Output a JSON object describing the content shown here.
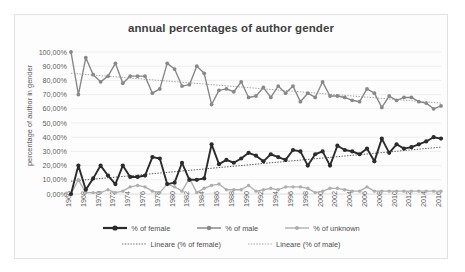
{
  "chart_data": {
    "type": "line",
    "title": "annual percentages of author gender",
    "xlabel": "",
    "ylabel": "percentage of author in gender",
    "ylim": [
      0,
      100
    ],
    "ytick_labels": [
      "100,00%",
      "90,00%",
      "80,00%",
      "70,00%",
      "60,00%",
      "50,00%",
      "40,00%",
      "30,00%",
      "20,00%",
      "10,00%",
      "0,00%"
    ],
    "ytick_values": [
      100,
      90,
      80,
      70,
      60,
      50,
      40,
      30,
      20,
      10,
      0
    ],
    "grid": true,
    "legend_position": "bottom",
    "x": [
      1966,
      1967,
      1968,
      1969,
      1970,
      1971,
      1972,
      1973,
      1974,
      1975,
      1976,
      1977,
      1978,
      1979,
      1980,
      1981,
      1982,
      1983,
      1984,
      1985,
      1986,
      1987,
      1988,
      1989,
      1990,
      1991,
      1992,
      1993,
      1994,
      1995,
      1996,
      1997,
      1998,
      1999,
      2000,
      2001,
      2002,
      2003,
      2004,
      2005,
      2006,
      2007,
      2008,
      2009,
      2010,
      2011,
      2012,
      2013,
      2014,
      2015,
      2016
    ],
    "xtick_labels": [
      "1966",
      "1968",
      "1970",
      "1972",
      "1974",
      "1976",
      "1978",
      "1980",
      "1982",
      "1984",
      "1986",
      "1988",
      "1990",
      "1992",
      "1994",
      "1996",
      "1998",
      "2000",
      "2002",
      "2004",
      "2006",
      "2008",
      "2010",
      "2012",
      "2014",
      "2016"
    ],
    "series": [
      {
        "name": "% of female",
        "color": "#2b2b2b",
        "width": 1.9,
        "marker": 2.1,
        "values": [
          0,
          20,
          3,
          11,
          20,
          13,
          7,
          20,
          12,
          12,
          13,
          26,
          25,
          7,
          8,
          22,
          10,
          10,
          11,
          35,
          21,
          24,
          22,
          25,
          29,
          27,
          23,
          28,
          26,
          24,
          31,
          30,
          20,
          28,
          30,
          20,
          34,
          31,
          30,
          28,
          32,
          23,
          39,
          29,
          35,
          32,
          33,
          35,
          37,
          40,
          39
        ]
      },
      {
        "name": "% of male",
        "color": "#888888",
        "width": 1.4,
        "marker": 1.9,
        "values": [
          100,
          70,
          96,
          84,
          79,
          83,
          92,
          78,
          83,
          83,
          83,
          71,
          74,
          92,
          88,
          76,
          77,
          90,
          85,
          63,
          73,
          74,
          72,
          79,
          68,
          69,
          75,
          68,
          76,
          71,
          76,
          65,
          71,
          68,
          79,
          69,
          69,
          68,
          66,
          65,
          74,
          71,
          61,
          69,
          66,
          68,
          68,
          65,
          64,
          60,
          62
        ]
      },
      {
        "name": "% of unknown",
        "color": "#aeaeae",
        "width": 1.3,
        "marker": 1.7,
        "values": [
          0,
          10,
          1,
          1,
          1,
          3,
          1,
          2,
          5,
          6,
          5,
          2,
          1,
          7,
          5,
          2,
          11,
          1,
          4,
          6,
          7,
          3,
          3,
          3,
          6,
          2,
          3,
          4,
          3,
          5,
          5,
          5,
          4,
          1,
          2,
          4,
          4,
          3,
          2,
          2,
          5,
          2,
          2,
          2,
          2,
          2,
          2,
          2,
          2,
          2,
          2
        ]
      }
    ],
    "trendlines": [
      {
        "name": "Lineare (% of female)",
        "color": "#4a4a4a",
        "y_start": 9,
        "y_end": 33
      },
      {
        "name": "Lineare (% of male)",
        "color": "#9a9a9a",
        "y_start": 85,
        "y_end": 64
      }
    ]
  },
  "legend": {
    "row1": [
      {
        "label": "% of female",
        "color": "#2b2b2b",
        "width": 2.2,
        "marker": 2.6,
        "dashed": false
      },
      {
        "label": "% of male",
        "color": "#888888",
        "width": 1.5,
        "marker": 2.2,
        "dashed": false
      },
      {
        "label": "% of unknown",
        "color": "#aeaeae",
        "width": 1.4,
        "marker": 2.0,
        "dashed": false
      }
    ],
    "row2": [
      {
        "label": "Lineare (% of female)",
        "color": "#6e6e6e",
        "width": 1.1,
        "marker": 0,
        "dashed": true
      },
      {
        "label": "Lineare (% of male)",
        "color": "#a8a8a8",
        "width": 1.1,
        "marker": 0,
        "dashed": true
      }
    ]
  }
}
